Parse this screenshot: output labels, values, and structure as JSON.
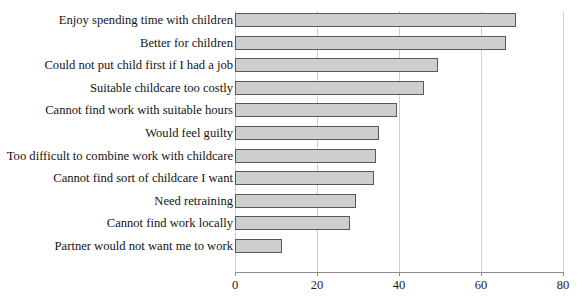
{
  "chart_data": {
    "type": "bar",
    "orientation": "horizontal",
    "title": "",
    "xlabel": "",
    "ylabel": "",
    "xlim": [
      0,
      80
    ],
    "xticks": [
      0,
      20,
      40,
      60,
      80
    ],
    "grid": true,
    "legend": "none",
    "bar_color": "#cecece",
    "bar_border_color": "#595959",
    "axis_color": "#8c8c8c",
    "grid_color": "#cfcfcf",
    "categories": [
      "Enjoy spending time with children",
      "Better for children",
      "Could not put child first if I had a job",
      "Suitable childcare too costly",
      "Cannot find work with suitable hours",
      "Would feel guilty",
      "Too difficult to combine work with childcare",
      "Cannot find sort of childcare I want",
      "Need retraining",
      "Cannot find work locally",
      "Partner would not want me to work"
    ],
    "values": [
      68.5,
      66,
      49.5,
      46,
      39.5,
      35,
      34.5,
      34,
      29.5,
      28,
      11.5
    ]
  }
}
